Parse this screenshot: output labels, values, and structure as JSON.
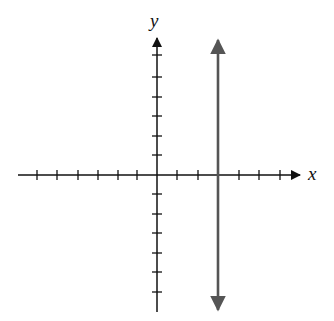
{
  "figure": {
    "type": "coordinate-plane",
    "x_axis_label": "x",
    "y_axis_label": "y",
    "x_ticks": [
      -6,
      -5,
      -4,
      -3,
      -2,
      -1,
      1,
      2,
      3,
      4,
      5,
      6
    ],
    "y_ticks": [
      -7,
      -6,
      -5,
      -4,
      -3,
      -2,
      -1,
      1,
      2,
      3,
      4,
      5,
      6
    ],
    "graphed_line": {
      "equation": "x = 3",
      "description": "vertical line with arrows at both ends",
      "color": "#555555"
    },
    "axis_color": "#111111"
  }
}
